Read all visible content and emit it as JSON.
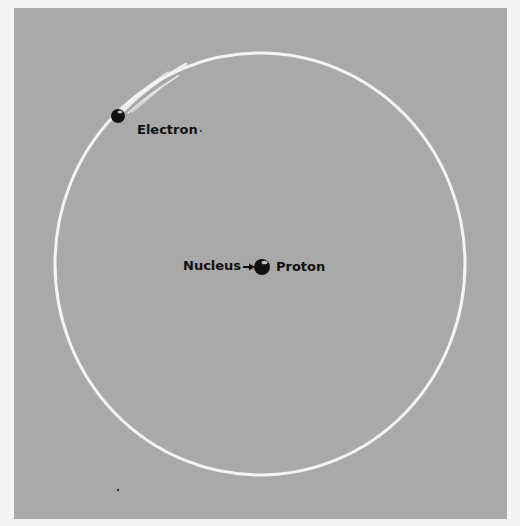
{
  "diagram": {
    "labels": {
      "electron": "Electron",
      "nucleus": "Nucleus",
      "proton": "Proton"
    },
    "colors": {
      "background": "#a9a9a9",
      "orbit": "#f4f4f4",
      "particle": "#111111",
      "text": "#111111"
    },
    "orbit": {
      "cx": 260,
      "cy": 264,
      "rx": 205,
      "ry": 211
    },
    "electron": {
      "cx": 118,
      "cy": 116,
      "r": 7
    },
    "proton": {
      "cx": 262,
      "cy": 267,
      "r": 8
    }
  }
}
